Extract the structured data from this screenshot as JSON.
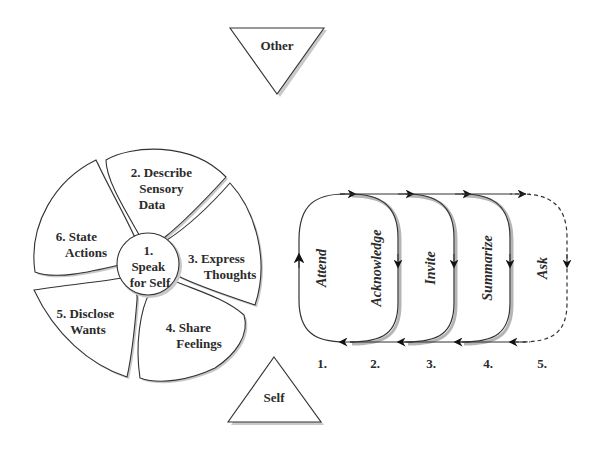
{
  "triangles": {
    "other": {
      "label": "Other",
      "orientation": "down"
    },
    "self": {
      "label": "Self",
      "orientation": "up"
    }
  },
  "wheel": {
    "center": {
      "label_lines": [
        "1.",
        "Speak",
        "for Self"
      ]
    },
    "petals": [
      {
        "id": 2,
        "label_lines": [
          "2. Describe",
          "Sensory",
          "Data"
        ]
      },
      {
        "id": 3,
        "label_lines": [
          "3. Express",
          "Thoughts"
        ]
      },
      {
        "id": 4,
        "label_lines": [
          "4. Share",
          "Feelings"
        ]
      },
      {
        "id": 5,
        "label_lines": [
          "5. Disclose",
          "Wants"
        ]
      },
      {
        "id": 6,
        "label_lines": [
          "6. State",
          "Actions"
        ]
      }
    ]
  },
  "loops": {
    "steps": [
      {
        "number": "1.",
        "label": "Attend",
        "style": "solid"
      },
      {
        "number": "2.",
        "label": "Acknowledge",
        "style": "solid"
      },
      {
        "number": "3.",
        "label": "Invite",
        "style": "solid"
      },
      {
        "number": "4.",
        "label": "Summarize",
        "style": "solid"
      },
      {
        "number": "5.",
        "label": "Ask",
        "style": "dashed"
      }
    ]
  },
  "colors": {
    "line": "#333333",
    "shadow": "#b5b5b5",
    "text": "#2b2b2b",
    "background": "#ffffff"
  }
}
